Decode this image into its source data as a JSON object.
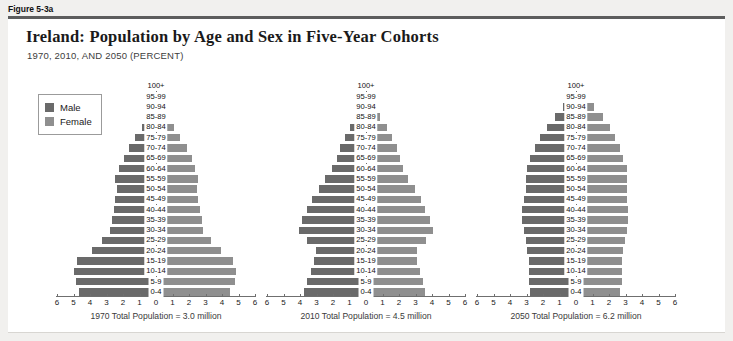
{
  "figure": {
    "number": "Figure 5-3a",
    "title": "Ireland: Population by Age and Sex in Five-Year Cohorts",
    "subtitle": "1970, 2010, AND 2050 (PERCENT)"
  },
  "legend": {
    "items": [
      {
        "label": "Male",
        "color": "#6a6a6a"
      },
      {
        "label": "Female",
        "color": "#8f8f8f"
      }
    ]
  },
  "axis": {
    "ticks": [
      "6",
      "5",
      "4",
      "3",
      "2",
      "1",
      "0",
      "1",
      "2",
      "3",
      "4",
      "5",
      "6"
    ],
    "max": 6,
    "xlabel": "",
    "ylabel": ""
  },
  "cohorts": [
    "100+",
    "95-99",
    "90-94",
    "85-89",
    "80-84",
    "75-79",
    "70-74",
    "65-69",
    "60-64",
    "55-59",
    "50-54",
    "45-49",
    "40-44",
    "35-39",
    "30-34",
    "25-29",
    "20-24",
    "15-19",
    "10-14",
    "5-9",
    "0-4"
  ],
  "chart_data": {
    "type": "bar",
    "orientation": "population-pyramid",
    "title": "Ireland: Population by Age and Sex in Five-Year Cohorts",
    "subtitle": "1970, 2010, AND 2050 (PERCENT)",
    "xlabel": "Percent",
    "ylabel": "Age cohort",
    "xlim": [
      -6,
      6
    ],
    "xticks": [
      6,
      5,
      4,
      3,
      2,
      1,
      0,
      1,
      2,
      3,
      4,
      5,
      6
    ],
    "grid": false,
    "legend_position": "top-left",
    "categories": [
      "100+",
      "95-99",
      "90-94",
      "85-89",
      "80-84",
      "75-79",
      "70-74",
      "65-69",
      "60-64",
      "55-59",
      "50-54",
      "45-49",
      "40-44",
      "35-39",
      "30-34",
      "25-29",
      "20-24",
      "15-19",
      "10-14",
      "5-9",
      "0-4"
    ],
    "panels": [
      {
        "year": "1970",
        "caption": "1970 Total Population = 3.0 million",
        "total_population_millions": 3.0,
        "series": [
          {
            "name": "Male",
            "values": [
              0.02,
              0.05,
              0.15,
              0.4,
              0.8,
              1.2,
              1.6,
              1.9,
              2.2,
              2.4,
              2.3,
              2.4,
              2.5,
              2.6,
              2.7,
              3.2,
              3.8,
              4.7,
              4.9,
              4.8,
              4.6
            ]
          },
          {
            "name": "Female",
            "values": [
              0.03,
              0.08,
              0.2,
              0.5,
              1.0,
              1.4,
              1.8,
              2.1,
              2.3,
              2.5,
              2.4,
              2.5,
              2.6,
              2.7,
              2.8,
              3.3,
              3.9,
              4.6,
              4.8,
              4.7,
              4.4
            ]
          }
        ]
      },
      {
        "year": "2010",
        "caption": "2010 Total Population = 4.5 million",
        "total_population_millions": 4.5,
        "series": [
          {
            "name": "Male",
            "values": [
              0.02,
              0.08,
              0.25,
              0.55,
              0.9,
              1.2,
              1.5,
              1.7,
              2.0,
              2.4,
              2.8,
              3.2,
              3.5,
              3.8,
              4.0,
              3.5,
              3.0,
              3.1,
              3.3,
              3.5,
              3.7
            ]
          },
          {
            "name": "Female",
            "values": [
              0.04,
              0.15,
              0.4,
              0.8,
              1.2,
              1.5,
              1.8,
              2.0,
              2.2,
              2.5,
              2.9,
              3.3,
              3.5,
              3.8,
              4.0,
              3.6,
              3.0,
              3.0,
              3.2,
              3.4,
              3.5
            ]
          }
        ]
      },
      {
        "year": "2050",
        "caption": "2050 Total Population = 6.2 million",
        "total_population_millions": 6.2,
        "series": [
          {
            "name": "Male",
            "values": [
              0.1,
              0.3,
              0.7,
              1.2,
              1.7,
              2.1,
              2.4,
              2.7,
              2.9,
              3.0,
              3.0,
              3.1,
              3.2,
              3.2,
              3.1,
              3.0,
              2.9,
              2.8,
              2.8,
              2.8,
              2.7
            ]
          },
          {
            "name": "Female",
            "values": [
              0.2,
              0.5,
              1.0,
              1.6,
              2.0,
              2.3,
              2.6,
              2.8,
              3.0,
              3.0,
              3.0,
              3.0,
              3.1,
              3.1,
              3.0,
              2.9,
              2.8,
              2.7,
              2.7,
              2.7,
              2.6
            ]
          }
        ]
      }
    ]
  }
}
